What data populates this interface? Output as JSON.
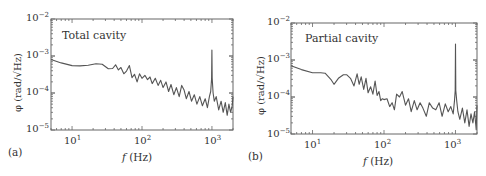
{
  "chart_data": [
    {
      "type": "line",
      "panel_tag": "(a)",
      "title": "Total cavity",
      "xlabel": "f (Hz)",
      "ylabel": "φ (rad/√Hz)",
      "xscale": "log",
      "yscale": "log",
      "xlim": [
        5,
        2000
      ],
      "ylim": [
        1e-05,
        0.01
      ],
      "xticks": [
        "10^1",
        "10^2",
        "10^3"
      ],
      "yticks": [
        "10^-2",
        "10^-3",
        "10^-4",
        "10^-5"
      ],
      "grid": false,
      "color": "#555555",
      "x": [
        5,
        7,
        10,
        13,
        17,
        22,
        27,
        33,
        38,
        42,
        46,
        50,
        55,
        60,
        66,
        72,
        78,
        85,
        92,
        100,
        110,
        120,
        130,
        140,
        155,
        170,
        185,
        200,
        220,
        240,
        260,
        285,
        310,
        340,
        370,
        400,
        430,
        470,
        510,
        560,
        610,
        670,
        730,
        800,
        860,
        920,
        960,
        990,
        1000,
        1010,
        1040,
        1080,
        1150,
        1250,
        1350,
        1450,
        1550,
        1650,
        1750,
        1850,
        1950,
        2000
      ],
      "values": [
        0.0008,
        0.00065,
        0.00055,
        0.00054,
        0.00056,
        0.00062,
        0.0006,
        0.00045,
        0.00046,
        0.00058,
        0.00042,
        0.00049,
        0.00033,
        0.00039,
        0.00055,
        0.00026,
        0.00032,
        0.0002,
        0.00033,
        0.00025,
        0.0003,
        0.00023,
        0.00027,
        0.00018,
        0.00025,
        0.00016,
        0.00022,
        0.00014,
        0.0002,
        0.00011,
        0.00017,
        9e-05,
        0.00014,
        8e-05,
        0.00016,
        0.00012,
        7e-05,
        0.00011,
        6e-05,
        9e-05,
        5e-05,
        8e-05,
        4.5e-05,
        7e-05,
        4e-05,
        8e-05,
        0.00011,
        0.00025,
        0.00145,
        0.00025,
        0.0001,
        6e-05,
        8e-05,
        3.5e-05,
        6e-05,
        3e-05,
        5.5e-05,
        2.5e-05,
        5e-05,
        3e-05,
        4.5e-05,
        8e-05
      ]
    },
    {
      "type": "line",
      "panel_tag": "(b)",
      "title": "Partial cavity",
      "xlabel": "f (Hz)",
      "ylabel": "φ (rad/√Hz)",
      "xscale": "log",
      "yscale": "log",
      "xlim": [
        5,
        2000
      ],
      "ylim": [
        1e-05,
        0.01
      ],
      "xticks": [
        "10^1",
        "10^2",
        "10^3"
      ],
      "yticks": [
        "10^-2",
        "10^-3",
        "10^-4",
        "10^-5"
      ],
      "grid": false,
      "color": "#555555",
      "x": [
        5,
        7,
        10,
        13,
        15,
        18,
        20,
        23,
        27,
        30,
        34,
        38,
        42,
        45,
        48,
        52,
        56,
        60,
        65,
        70,
        75,
        80,
        85,
        90,
        95,
        100,
        110,
        120,
        130,
        140,
        150,
        165,
        180,
        200,
        220,
        240,
        265,
        290,
        320,
        350,
        390,
        430,
        480,
        530,
        590,
        650,
        720,
        790,
        860,
        930,
        970,
        990,
        1000,
        1010,
        1040,
        1080,
        1150,
        1250,
        1350,
        1450,
        1550,
        1650,
        1750,
        1850,
        1950,
        2000
      ],
      "values": [
        0.0007,
        0.00055,
        0.00045,
        0.00045,
        0.00044,
        0.0003,
        0.00022,
        0.00032,
        0.0004,
        0.0004,
        0.00032,
        0.0002,
        0.00042,
        0.00022,
        0.00035,
        0.00016,
        0.00032,
        0.00013,
        0.00019,
        0.00012,
        0.00027,
        0.00011,
        0.00014,
        8e-05,
        9e-05,
        8.5e-05,
        9e-05,
        5.5e-05,
        7e-05,
        4.5e-05,
        0.00012,
        0.0001,
        0.00014,
        6e-05,
        9e-05,
        4e-05,
        8e-05,
        4.5e-05,
        7e-05,
        5e-05,
        3e-05,
        7e-05,
        5e-05,
        4.5e-05,
        7e-05,
        3e-05,
        6.5e-05,
        4e-05,
        5.5e-05,
        3.5e-05,
        8e-05,
        0.00015,
        0.0027,
        0.00015,
        8e-05,
        4e-05,
        2.5e-05,
        5e-05,
        2e-05,
        4.5e-05,
        1.6e-05,
        3.5e-05,
        2e-05,
        4e-05,
        1.3e-05,
        6e-05
      ]
    }
  ],
  "panels": [
    {
      "tag": "(a)",
      "title": "Total cavity",
      "ylabel": "φ (rad/√Hz)",
      "xlabel_var": "f",
      "xlabel_unit": " (Hz)",
      "yticks": [
        {
          "base": "10",
          "exp": "−2"
        },
        {
          "base": "10",
          "exp": "−3"
        },
        {
          "base": "10",
          "exp": "−4"
        },
        {
          "base": "10",
          "exp": "−5"
        }
      ],
      "xticks": [
        {
          "base": "10",
          "exp": "1"
        },
        {
          "base": "10",
          "exp": "2"
        },
        {
          "base": "10",
          "exp": "3"
        }
      ]
    },
    {
      "tag": "(b)",
      "title": "Partial cavity",
      "ylabel": "φ (rad/√Hz)",
      "xlabel_var": "f",
      "xlabel_unit": " (Hz)",
      "yticks": [
        {
          "base": "10",
          "exp": "−2"
        },
        {
          "base": "10",
          "exp": "−3"
        },
        {
          "base": "10",
          "exp": "−4"
        },
        {
          "base": "10",
          "exp": "−5"
        }
      ],
      "xticks": [
        {
          "base": "10",
          "exp": "1"
        },
        {
          "base": "10",
          "exp": "2"
        },
        {
          "base": "10",
          "exp": "3"
        }
      ]
    }
  ]
}
